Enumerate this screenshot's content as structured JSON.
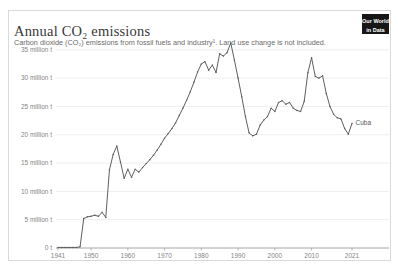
{
  "header": {
    "title": "Annual CO₂ emissions",
    "subtitle": "Carbon dioxide (CO₂) emissions from fossil fuels and industry¹. Land use change is not included.",
    "logo_line1": "Our World",
    "logo_line2": "in Data"
  },
  "chart_data": {
    "type": "line",
    "title": "Annual CO₂ emissions",
    "entity": "Cuba",
    "series_label": "Cuba",
    "unit": "million t",
    "ylim": [
      0,
      36.5
    ],
    "grid": true,
    "legend_position": "end-of-line",
    "line_color": "#5f5f5f",
    "x": [
      1941,
      1942,
      1943,
      1944,
      1945,
      1946,
      1947,
      1948,
      1949,
      1950,
      1951,
      1952,
      1953,
      1954,
      1955,
      1956,
      1957,
      1958,
      1959,
      1960,
      1961,
      1962,
      1963,
      1964,
      1965,
      1966,
      1967,
      1968,
      1969,
      1970,
      1971,
      1972,
      1973,
      1974,
      1975,
      1976,
      1977,
      1978,
      1979,
      1980,
      1981,
      1982,
      1983,
      1984,
      1985,
      1986,
      1987,
      1988,
      1989,
      1990,
      1991,
      1992,
      1993,
      1994,
      1995,
      1996,
      1997,
      1998,
      1999,
      2000,
      2001,
      2002,
      2003,
      2004,
      2005,
      2006,
      2007,
      2008,
      2009,
      2010,
      2011,
      2012,
      2013,
      2014,
      2015,
      2016,
      2017,
      2018,
      2019,
      2020,
      2021
    ],
    "values": [
      0.1,
      0.1,
      0.1,
      0.1,
      0.1,
      0.1,
      0.2,
      5.2,
      5.5,
      5.6,
      5.8,
      5.6,
      6.3,
      5.4,
      13.8,
      16.5,
      18.0,
      15.2,
      12.3,
      13.9,
      12.5,
      13.9,
      13.4,
      14.2,
      14.9,
      15.6,
      16.4,
      17.3,
      18.3,
      19.4,
      20.2,
      21.1,
      22.1,
      23.4,
      24.7,
      26.1,
      27.6,
      29.3,
      31.1,
      32.5,
      32.9,
      31.4,
      32.3,
      31.0,
      34.3,
      33.9,
      34.5,
      36.2,
      33.2,
      30.0,
      26.7,
      23.2,
      20.3,
      19.8,
      20.1,
      21.7,
      22.6,
      23.2,
      24.7,
      24.1,
      25.7,
      26.0,
      25.4,
      25.7,
      24.7,
      24.3,
      24.1,
      25.9,
      31.0,
      33.6,
      30.3,
      30.0,
      30.4,
      27.3,
      25.0,
      23.6,
      23.0,
      22.8,
      21.1,
      20.1,
      22.0
    ],
    "ytick_values": [
      0,
      5,
      10,
      15,
      20,
      25,
      30,
      35
    ],
    "ytick_labels": [
      "0 t",
      "5 million t",
      "10 million t",
      "15 million t",
      "20 million t",
      "25 million t",
      "30 million t",
      "35 million t"
    ],
    "xtick_values": [
      1941,
      1950,
      1960,
      1970,
      1980,
      1990,
      2000,
      2010,
      2021
    ],
    "xtick_labels": [
      "1941",
      "1950",
      "1960",
      "1970",
      "1980",
      "1990",
      "2000",
      "2010",
      "2021"
    ]
  },
  "colors": {
    "line": "#5f5f5f",
    "entity_label": "#565656",
    "gridline": "#eaeaea",
    "axis": "#9c9c9c",
    "tick_text": "#858585",
    "logo_bg": "#161616",
    "card_border": "#d9d9d9"
  }
}
